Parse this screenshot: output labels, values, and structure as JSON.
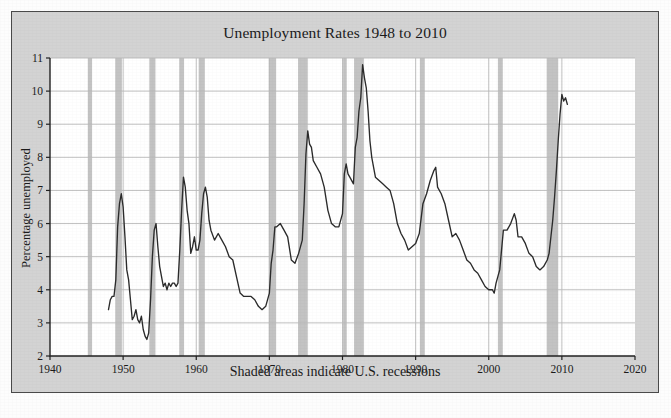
{
  "figure": {
    "title": "Unemployment Rates 1948 to 2010",
    "caption": "Shaded areas indicate U.S. recessions",
    "ylabel": "Percentage unemployed",
    "panel_color": "#d3d3d3",
    "plot_background": "#ffffff",
    "border_color": "#4a4a4a",
    "line_color": "#2b2b2b",
    "grid_color": "#b9b9b9",
    "recession_band_color": "#c3c3c3"
  },
  "chart_data": {
    "type": "line",
    "title": "Unemployment Rates 1948 to 2010",
    "subtitle": "Shaded areas indicate U.S. recessions",
    "xlabel": "",
    "ylabel": "Percentage unemployed",
    "xlim": [
      1940,
      2020
    ],
    "ylim": [
      2,
      11
    ],
    "xticks": [
      1940,
      1950,
      1960,
      1970,
      1980,
      1990,
      2000,
      2010,
      2020
    ],
    "yticks": [
      2,
      3,
      4,
      5,
      6,
      7,
      8,
      9,
      10,
      11
    ],
    "grid": "horizontal-and-vertical",
    "legend": "none",
    "series": [
      {
        "name": "Percentage unemployed",
        "color": "#2b2b2b",
        "x": [
          1948.0,
          1948.25,
          1948.5,
          1948.75,
          1949.0,
          1949.25,
          1949.5,
          1949.75,
          1950.0,
          1950.25,
          1950.5,
          1950.75,
          1951.0,
          1951.25,
          1951.5,
          1951.75,
          1952.0,
          1952.25,
          1952.5,
          1952.75,
          1953.0,
          1953.25,
          1953.5,
          1953.75,
          1954.0,
          1954.25,
          1954.5,
          1954.75,
          1955.0,
          1955.25,
          1955.5,
          1955.75,
          1956.0,
          1956.25,
          1956.5,
          1956.75,
          1957.0,
          1957.25,
          1957.5,
          1957.75,
          1958.0,
          1958.25,
          1958.5,
          1958.75,
          1959.0,
          1959.25,
          1959.5,
          1959.75,
          1960.0,
          1960.25,
          1960.5,
          1960.75,
          1961.0,
          1961.25,
          1961.5,
          1961.75,
          1962.0,
          1962.5,
          1963.0,
          1963.5,
          1964.0,
          1964.5,
          1965.0,
          1965.5,
          1966.0,
          1966.5,
          1967.0,
          1967.5,
          1968.0,
          1968.5,
          1969.0,
          1969.5,
          1970.0,
          1970.25,
          1970.5,
          1970.75,
          1971.0,
          1971.5,
          1972.0,
          1972.5,
          1973.0,
          1973.5,
          1974.0,
          1974.5,
          1974.75,
          1975.0,
          1975.25,
          1975.5,
          1975.75,
          1976.0,
          1976.5,
          1977.0,
          1977.5,
          1978.0,
          1978.5,
          1979.0,
          1979.5,
          1980.0,
          1980.25,
          1980.5,
          1980.75,
          1981.0,
          1981.5,
          1981.75,
          1982.0,
          1982.25,
          1982.5,
          1982.75,
          1983.0,
          1983.25,
          1983.5,
          1983.75,
          1984.0,
          1984.5,
          1985.0,
          1985.5,
          1986.0,
          1986.5,
          1987.0,
          1987.5,
          1988.0,
          1988.5,
          1989.0,
          1989.5,
          1990.0,
          1990.5,
          1991.0,
          1991.5,
          1992.0,
          1992.5,
          1992.75,
          1993.0,
          1993.5,
          1994.0,
          1994.5,
          1995.0,
          1995.5,
          1996.0,
          1996.5,
          1997.0,
          1997.5,
          1998.0,
          1998.5,
          1999.0,
          1999.5,
          2000.0,
          2000.5,
          2000.75,
          2001.0,
          2001.5,
          2002.0,
          2002.5,
          2003.0,
          2003.5,
          2003.75,
          2004.0,
          2004.5,
          2005.0,
          2005.5,
          2006.0,
          2006.5,
          2007.0,
          2007.5,
          2008.0,
          2008.25,
          2008.5,
          2008.75,
          2009.0,
          2009.25,
          2009.5,
          2009.75,
          2010.0,
          2010.25,
          2010.5,
          2010.75
        ],
        "y": [
          3.4,
          3.7,
          3.8,
          3.8,
          4.3,
          5.9,
          6.6,
          6.9,
          6.5,
          5.6,
          4.6,
          4.3,
          3.7,
          3.1,
          3.2,
          3.4,
          3.1,
          3.0,
          3.2,
          2.8,
          2.6,
          2.5,
          2.7,
          3.7,
          5.0,
          5.8,
          6.0,
          5.3,
          4.7,
          4.4,
          4.1,
          4.2,
          4.0,
          4.2,
          4.1,
          4.2,
          4.2,
          4.1,
          4.2,
          5.2,
          6.4,
          7.4,
          7.1,
          6.4,
          6.0,
          5.1,
          5.3,
          5.6,
          5.2,
          5.2,
          5.5,
          6.3,
          6.9,
          7.1,
          6.8,
          6.1,
          5.8,
          5.5,
          5.7,
          5.5,
          5.3,
          5.0,
          4.9,
          4.4,
          3.9,
          3.8,
          3.8,
          3.8,
          3.7,
          3.5,
          3.4,
          3.5,
          3.9,
          4.8,
          5.2,
          5.9,
          5.9,
          6.0,
          5.8,
          5.6,
          4.9,
          4.8,
          5.1,
          5.5,
          6.6,
          8.1,
          8.8,
          8.4,
          8.3,
          7.9,
          7.7,
          7.5,
          7.1,
          6.4,
          6.0,
          5.9,
          5.9,
          6.3,
          7.5,
          7.8,
          7.5,
          7.4,
          7.2,
          8.3,
          8.6,
          9.4,
          9.8,
          10.8,
          10.4,
          10.1,
          9.4,
          8.5,
          8.0,
          7.4,
          7.3,
          7.2,
          7.1,
          7.0,
          6.6,
          6.0,
          5.7,
          5.5,
          5.2,
          5.3,
          5.4,
          5.7,
          6.6,
          6.9,
          7.3,
          7.6,
          7.7,
          7.1,
          6.9,
          6.6,
          6.1,
          5.6,
          5.7,
          5.5,
          5.2,
          4.9,
          4.8,
          4.6,
          4.5,
          4.3,
          4.1,
          4.0,
          4.0,
          3.9,
          4.2,
          4.6,
          5.8,
          5.8,
          6.0,
          6.3,
          6.1,
          5.6,
          5.6,
          5.4,
          5.1,
          5.0,
          4.7,
          4.6,
          4.7,
          4.9,
          5.1,
          5.6,
          6.1,
          6.8,
          7.6,
          8.5,
          9.3,
          9.9,
          9.7,
          9.8,
          9.6
        ]
      }
    ],
    "recessions": [
      {
        "label": "1945",
        "start": 1945.17,
        "end": 1945.75
      },
      {
        "label": "1948-1949",
        "start": 1948.92,
        "end": 1949.83
      },
      {
        "label": "1953-1954",
        "start": 1953.58,
        "end": 1954.42
      },
      {
        "label": "1957-1958",
        "start": 1957.67,
        "end": 1958.33
      },
      {
        "label": "1960-1961",
        "start": 1960.33,
        "end": 1961.17
      },
      {
        "label": "1969-1970",
        "start": 1969.92,
        "end": 1970.92
      },
      {
        "label": "1973-1975",
        "start": 1973.92,
        "end": 1975.25
      },
      {
        "label": "1980",
        "start": 1980.08,
        "end": 1980.58
      },
      {
        "label": "1981-1982",
        "start": 1981.58,
        "end": 1982.92
      },
      {
        "label": "1990-1991",
        "start": 1990.58,
        "end": 1991.25
      },
      {
        "label": "2001",
        "start": 2001.25,
        "end": 2001.92
      },
      {
        "label": "2007-2009",
        "start": 2007.92,
        "end": 2009.5
      }
    ]
  }
}
